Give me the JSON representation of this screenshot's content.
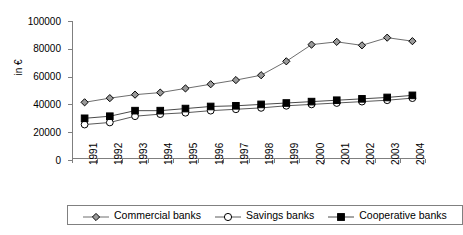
{
  "chart_data": {
    "type": "line",
    "title": "",
    "xlabel": "",
    "ylabel": "in €",
    "categories": [
      "1991",
      "1992",
      "1993",
      "1994",
      "1995",
      "1996",
      "1997",
      "1998",
      "1999",
      "2000",
      "2001",
      "2002",
      "2003",
      "2004"
    ],
    "ylim": [
      0,
      100000
    ],
    "ytick_values": [
      0,
      20000,
      40000,
      60000,
      80000,
      100000
    ],
    "ytick_labels": [
      "0",
      "20000",
      "40000",
      "60000",
      "80000",
      "100000"
    ],
    "grid": false,
    "legend_position": "bottom",
    "series": [
      {
        "name": "Commercial banks",
        "marker": "diamond",
        "marker_fill": "#9a9a9a",
        "line_color": "#6e6e6e",
        "values": [
          41500,
          44500,
          47000,
          48500,
          51500,
          54500,
          57500,
          61000,
          71000,
          83000,
          85000,
          82500,
          88000,
          85500
        ]
      },
      {
        "name": "Savings banks",
        "marker": "circle",
        "marker_fill": "#ffffff",
        "line_color": "#5a5a5a",
        "values": [
          25500,
          27000,
          31500,
          33000,
          34000,
          35500,
          36500,
          37500,
          39000,
          40000,
          41000,
          42000,
          43000,
          44500
        ]
      },
      {
        "name": "Cooperative banks",
        "marker": "square",
        "marker_fill": "#000000",
        "line_color": "#4a4a4a",
        "values": [
          30000,
          31500,
          35500,
          35500,
          37000,
          38500,
          39000,
          40000,
          41000,
          42000,
          43000,
          44000,
          45000,
          46500
        ]
      }
    ]
  }
}
